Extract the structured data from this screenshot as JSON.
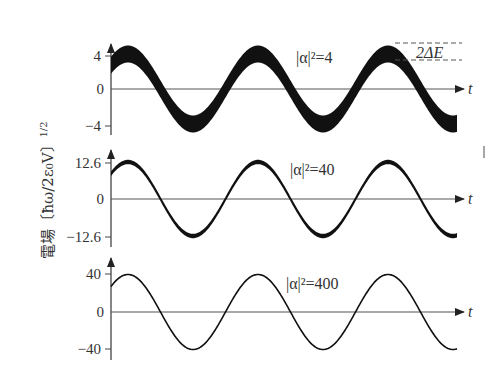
{
  "chart_data": [
    {
      "type": "line",
      "panel": "top",
      "title": "",
      "annotation": "|α|²=4",
      "band_annotation": "2ΔE",
      "xlabel": "t",
      "ylabel": "電場 (ħω/2ε₀V)^1/2",
      "yticks": [
        "4",
        "0",
        "−4"
      ],
      "ytick_values": [
        4,
        0,
        -4
      ],
      "amplitude": 4,
      "band_halfwidth": 1,
      "periods_shown": 2.65,
      "ylim": [
        -5.2,
        5.2
      ]
    },
    {
      "type": "line",
      "panel": "middle",
      "annotation": "|α|²=40",
      "xlabel": "t",
      "yticks": [
        "12.6",
        "0",
        "−12.6"
      ],
      "ytick_values": [
        12.6,
        0,
        -12.6
      ],
      "amplitude": 12.6,
      "band_halfwidth": 1,
      "periods_shown": 2.65,
      "ylim": [
        -15,
        15
      ]
    },
    {
      "type": "line",
      "panel": "bottom",
      "annotation": "|α|²=400",
      "xlabel": "t",
      "yticks": [
        "40",
        "0",
        "−40"
      ],
      "ytick_values": [
        40,
        0,
        -40
      ],
      "amplitude": 40,
      "band_halfwidth": 1,
      "periods_shown": 2.65,
      "ylim": [
        -46,
        46
      ]
    }
  ],
  "labels": {
    "ylabel": "電場〔ħω/2ε₀V〕",
    "ylabel_exp": "1/2",
    "t": "t",
    "top": {
      "tick_pos": "4",
      "tick_zero": "0",
      "tick_neg": "−4",
      "anno": "|α|²=4",
      "band": "2ΔE"
    },
    "mid": {
      "tick_pos": "12.6",
      "tick_zero": "0",
      "tick_neg": "−12.6",
      "anno": "|α|²=40"
    },
    "bot": {
      "tick_pos": "40",
      "tick_zero": "0",
      "tick_neg": "−40",
      "anno": "|α|²=400"
    }
  },
  "colors": {
    "ink": "#111111",
    "axis": "#444444",
    "text": "#333333"
  }
}
